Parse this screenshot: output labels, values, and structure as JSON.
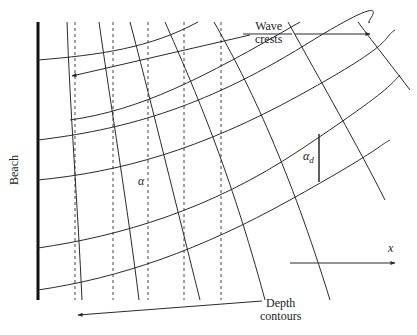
{
  "figure": {
    "labels": {
      "wave_crests_line1": "Wave",
      "wave_crests_line2": "crests",
      "depth_contours_line1": "Depth",
      "depth_contours_line2": "contours",
      "beach": "Beach",
      "alpha": "α",
      "alpha_d": "α",
      "alpha_d_sub": "d",
      "x_axis": "x"
    },
    "colors": {
      "line": "#2a2a2a",
      "beach": "#111111",
      "dashed": "#444444",
      "background": "#ffffff"
    },
    "beach_line": {
      "x": 38,
      "y1": 22,
      "y2": 300,
      "width": 3
    },
    "depth_contours_x": [
      75,
      113,
      148,
      184,
      221
    ],
    "depth_contours_y": [
      22,
      300
    ]
  }
}
